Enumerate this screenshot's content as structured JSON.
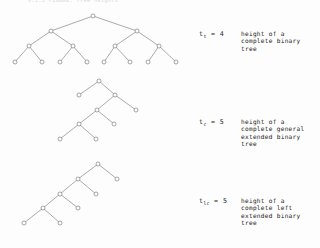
{
  "document": {
    "header_text": "6.2.2  FIGURE:  Tree heights",
    "background_color": "#fdfdfd",
    "ink_color": "#1b1b1b",
    "node_stroke_color": "#6e6e7a",
    "edge_stroke_color": "#76767f"
  },
  "figures": [
    {
      "id": "complete-binary-tree",
      "label": {
        "symbol": "t",
        "subscript": "t",
        "equals": "=",
        "value": "4",
        "description": "height of a\ncomplete binary\ntree"
      },
      "height": 4,
      "node_count": 15,
      "leaf_count": 8,
      "nodes": [
        {
          "id": "n0",
          "x": 93,
          "y": 16,
          "level": 0
        },
        {
          "id": "n1",
          "x": 51,
          "y": 31,
          "level": 1
        },
        {
          "id": "n2",
          "x": 137,
          "y": 31,
          "level": 1
        },
        {
          "id": "n3",
          "x": 29,
          "y": 46,
          "level": 2
        },
        {
          "id": "n4",
          "x": 73,
          "y": 46,
          "level": 2
        },
        {
          "id": "n5",
          "x": 115,
          "y": 46,
          "level": 2
        },
        {
          "id": "n6",
          "x": 159,
          "y": 46,
          "level": 2
        },
        {
          "id": "n7",
          "x": 15,
          "y": 62,
          "level": 3
        },
        {
          "id": "n8",
          "x": 42,
          "y": 62,
          "level": 3
        },
        {
          "id": "n9",
          "x": 60,
          "y": 62,
          "level": 3
        },
        {
          "id": "n10",
          "x": 87,
          "y": 62,
          "level": 3
        },
        {
          "id": "n11",
          "x": 104,
          "y": 62,
          "level": 3
        },
        {
          "id": "n12",
          "x": 130,
          "y": 62,
          "level": 3
        },
        {
          "id": "n13",
          "x": 148,
          "y": 62,
          "level": 3
        },
        {
          "id": "n14",
          "x": 176,
          "y": 62,
          "level": 3
        }
      ],
      "edges": [
        [
          "n0",
          "n1"
        ],
        [
          "n0",
          "n2"
        ],
        [
          "n1",
          "n3"
        ],
        [
          "n1",
          "n4"
        ],
        [
          "n2",
          "n5"
        ],
        [
          "n2",
          "n6"
        ],
        [
          "n3",
          "n7"
        ],
        [
          "n3",
          "n8"
        ],
        [
          "n4",
          "n9"
        ],
        [
          "n4",
          "n10"
        ],
        [
          "n5",
          "n11"
        ],
        [
          "n5",
          "n12"
        ],
        [
          "n6",
          "n13"
        ],
        [
          "n6",
          "n14"
        ]
      ],
      "label_position": {
        "left": 199,
        "top": 30
      }
    },
    {
      "id": "complete-general-extended-binary-tree",
      "label": {
        "symbol": "t",
        "subscript": "c",
        "equals": "=",
        "value": "5",
        "description": "height of a\ncomplete general\nextended binary\ntree"
      },
      "height": 5,
      "node_count": 9,
      "nodes": [
        {
          "id": "m0",
          "x": 99,
          "y": 81,
          "level": 0
        },
        {
          "id": "m1",
          "x": 79,
          "y": 95,
          "level": 1
        },
        {
          "id": "m2",
          "x": 115,
          "y": 95,
          "level": 1
        },
        {
          "id": "m3",
          "x": 136,
          "y": 110,
          "level": 2
        },
        {
          "id": "m4",
          "x": 97,
          "y": 110,
          "level": 2
        },
        {
          "id": "m5",
          "x": 114,
          "y": 124,
          "level": 3
        },
        {
          "id": "m6",
          "x": 79,
          "y": 124,
          "level": 3
        },
        {
          "id": "m7",
          "x": 60,
          "y": 139,
          "level": 4
        },
        {
          "id": "m8",
          "x": 96,
          "y": 139,
          "level": 4
        }
      ],
      "edges": [
        [
          "m0",
          "m1"
        ],
        [
          "m0",
          "m2"
        ],
        [
          "m2",
          "m4"
        ],
        [
          "m2",
          "m3"
        ],
        [
          "m4",
          "m6"
        ],
        [
          "m4",
          "m5"
        ],
        [
          "m6",
          "m7"
        ],
        [
          "m6",
          "m8"
        ]
      ],
      "label_position": {
        "left": 199,
        "top": 118
      }
    },
    {
      "id": "complete-left-extended-binary-tree",
      "label": {
        "symbol": "t",
        "subscript": "lc",
        "equals": "=",
        "value": "5",
        "description": "height of a\ncomplete left\nextended binary\ntree"
      },
      "height": 5,
      "node_count": 9,
      "nodes": [
        {
          "id": "p0",
          "x": 98,
          "y": 164,
          "level": 0
        },
        {
          "id": "p1",
          "x": 78,
          "y": 179,
          "level": 1
        },
        {
          "id": "p2",
          "x": 117,
          "y": 179,
          "level": 1
        },
        {
          "id": "p3",
          "x": 60,
          "y": 194,
          "level": 2
        },
        {
          "id": "p4",
          "x": 96,
          "y": 194,
          "level": 2
        },
        {
          "id": "p5",
          "x": 43,
          "y": 208,
          "level": 3
        },
        {
          "id": "p6",
          "x": 78,
          "y": 208,
          "level": 3
        },
        {
          "id": "p7",
          "x": 24,
          "y": 223,
          "level": 4
        },
        {
          "id": "p8",
          "x": 60,
          "y": 223,
          "level": 4
        }
      ],
      "edges": [
        [
          "p0",
          "p1"
        ],
        [
          "p0",
          "p2"
        ],
        [
          "p1",
          "p3"
        ],
        [
          "p1",
          "p4"
        ],
        [
          "p3",
          "p5"
        ],
        [
          "p3",
          "p6"
        ],
        [
          "p5",
          "p7"
        ],
        [
          "p5",
          "p8"
        ]
      ],
      "label_position": {
        "left": 199,
        "top": 197
      }
    }
  ]
}
